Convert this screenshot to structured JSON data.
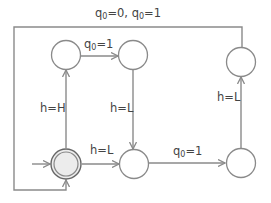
{
  "diagram": {
    "type": "state-machine",
    "colors": {
      "line": "#8a8a8a",
      "text": "#444444",
      "start_fill": "#ececec",
      "start_ring": "#666666"
    },
    "states": [
      {
        "id": "s0",
        "name": "start (accepting)",
        "x": 66,
        "y": 164
      },
      {
        "id": "s1",
        "name": "top-left",
        "x": 66,
        "y": 55
      },
      {
        "id": "s2",
        "name": "top-middle",
        "x": 133,
        "y": 55
      },
      {
        "id": "s3",
        "name": "bottom-middle",
        "x": 134,
        "y": 164
      },
      {
        "id": "s4",
        "name": "bottom-right",
        "x": 241,
        "y": 163
      },
      {
        "id": "s5",
        "name": "top-right",
        "x": 241,
        "y": 62
      }
    ],
    "transitions": [
      {
        "from": "s0",
        "to": "s1",
        "label": {
          "var": "h",
          "sub": "",
          "rest": "=H"
        }
      },
      {
        "from": "s1",
        "to": "s2",
        "label": {
          "var": "q",
          "sub": "0",
          "rest": "=1"
        }
      },
      {
        "from": "s2",
        "to": "s3",
        "label": {
          "var": "h",
          "sub": "",
          "rest": "=L"
        }
      },
      {
        "from": "s0",
        "to": "s3",
        "label": {
          "var": "h",
          "sub": "",
          "rest": "=L"
        }
      },
      {
        "from": "s3",
        "to": "s4",
        "label": {
          "var": "q",
          "sub": "0",
          "rest": "=1"
        }
      },
      {
        "from": "s4",
        "to": "s5",
        "label": {
          "var": "h",
          "sub": "",
          "rest": "=L"
        }
      },
      {
        "from": "s5",
        "to": "s0",
        "label": {
          "text": "q0=0, q0=1"
        }
      }
    ],
    "labels": {
      "top_loop": {
        "p1": "q",
        "s1": "0",
        "m1": "=0, ",
        "p2": "q",
        "s2": "0",
        "m2": "=1"
      },
      "s1_s2": {
        "p": "q",
        "s": "0",
        "m": "=1"
      },
      "s0_s1": "h=H",
      "s2_s3": "h=L",
      "s0_s3": "h=L",
      "s3_s4": {
        "p": "q",
        "s": "0",
        "m": "=1"
      },
      "s4_s5": "h=L"
    }
  }
}
